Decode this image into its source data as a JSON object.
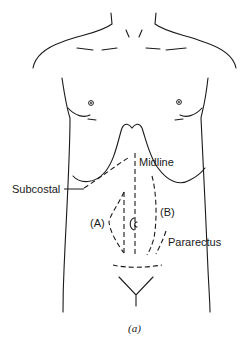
{
  "figure": {
    "caption": "(a)",
    "labels": {
      "midline": "Midline",
      "subcostal": "Subcostal",
      "a": "(A)",
      "b": "(B)",
      "pararectus": "Pararectus"
    },
    "colors": {
      "line": "#1a1a1a",
      "background": "#ffffff"
    }
  }
}
